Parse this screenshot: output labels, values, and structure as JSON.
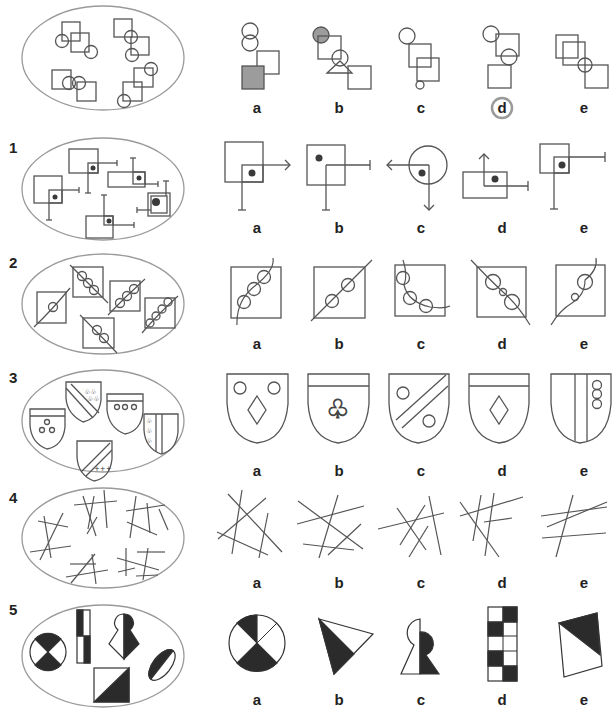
{
  "accent_color": "#9a9a9a",
  "answer_marker_color": "#9a9a9a",
  "rows": [
    {
      "number": "",
      "set_description": "Groups of two squares and two circles linked in chains",
      "options": [
        "a",
        "b",
        "c",
        "d",
        "e"
      ],
      "marked_answer": "d"
    },
    {
      "number": "1",
      "set_description": "Squares with dot and two perpendicular T-ended lines",
      "options": [
        "a",
        "b",
        "c",
        "d",
        "e"
      ],
      "marked_answer": ""
    },
    {
      "number": "2",
      "set_description": "Squares crossed by diagonal line with circles",
      "options": [
        "a",
        "b",
        "c",
        "d",
        "e"
      ],
      "marked_answer": ""
    },
    {
      "number": "3",
      "set_description": "Heraldic shields with emblems",
      "options": [
        "a",
        "b",
        "c",
        "d",
        "e"
      ],
      "marked_answer": ""
    },
    {
      "number": "4",
      "set_description": "Clusters of crossing lines",
      "options": [
        "a",
        "b",
        "c",
        "d",
        "e"
      ],
      "marked_answer": ""
    },
    {
      "number": "5",
      "set_description": "Black and white split shapes",
      "options": [
        "a",
        "b",
        "c",
        "d",
        "e"
      ],
      "marked_answer": ""
    }
  ],
  "option_labels": {
    "a": "a",
    "b": "b",
    "c": "c",
    "d": "d",
    "e": "e"
  }
}
